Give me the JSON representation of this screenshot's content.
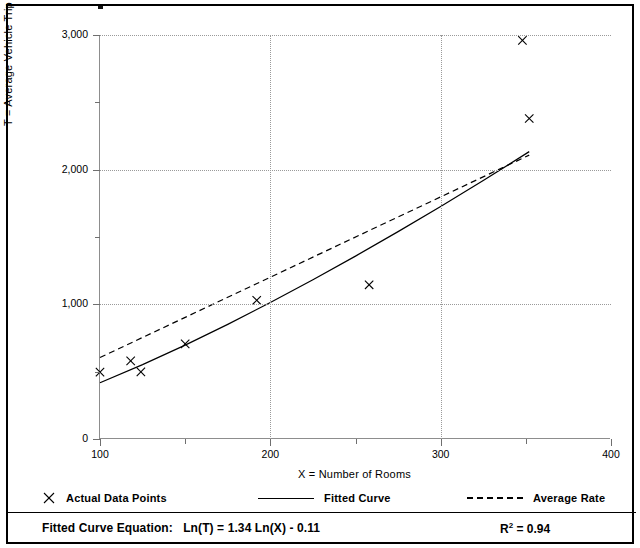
{
  "figure": {
    "frame_color": "#000000",
    "background": "#ffffff"
  },
  "chart_data": {
    "type": "scatter",
    "title": "",
    "xlabel": "X = Number of Rooms",
    "ylabel": "T = Average Vehicle Trip Ends",
    "xlim": [
      100,
      400
    ],
    "ylim": [
      0,
      3000
    ],
    "xticks": [
      100,
      200,
      300,
      400
    ],
    "xticklabels": [
      "100",
      "200",
      "300",
      "400"
    ],
    "xminorticks": [
      150,
      250,
      350
    ],
    "yticks": [
      0,
      1000,
      2000,
      3000
    ],
    "yticklabels": [
      "0",
      "1,000",
      "2,000",
      "3,000"
    ],
    "yminorticks": [
      500,
      1500,
      2500
    ],
    "grid": {
      "horizontal_at": [
        1000,
        2000,
        3000
      ],
      "vertical_at": [
        200,
        300
      ],
      "style": "dotted",
      "color": "#9a9a9a"
    },
    "series": [
      {
        "name": "Actual Data Points",
        "type": "scatter",
        "marker": "x",
        "color": "#000000",
        "points": [
          {
            "x": 100,
            "y": 497
          },
          {
            "x": 118,
            "y": 580
          },
          {
            "x": 124,
            "y": 498
          },
          {
            "x": 150,
            "y": 706
          },
          {
            "x": 192,
            "y": 1030
          },
          {
            "x": 258,
            "y": 1145
          },
          {
            "x": 348,
            "y": 2960
          },
          {
            "x": 352,
            "y": 2380
          }
        ]
      },
      {
        "name": "Fitted Curve",
        "type": "line",
        "linestyle": "solid",
        "color": "#000000",
        "equation": "Ln(T) = 1.34 Ln(X) - 0.11",
        "coefficients": {
          "slope": 1.34,
          "intercept": -0.11
        },
        "r_squared": 0.94,
        "points": [
          {
            "x": 100,
            "y": 418
          },
          {
            "x": 125,
            "y": 552
          },
          {
            "x": 150,
            "y": 697
          },
          {
            "x": 175,
            "y": 851
          },
          {
            "x": 200,
            "y": 1013
          },
          {
            "x": 225,
            "y": 1182
          },
          {
            "x": 250,
            "y": 1358
          },
          {
            "x": 275,
            "y": 1540
          },
          {
            "x": 300,
            "y": 1727
          },
          {
            "x": 325,
            "y": 1920
          },
          {
            "x": 352,
            "y": 2134
          }
        ]
      },
      {
        "name": "Average Rate",
        "type": "line",
        "linestyle": "dashed",
        "color": "#000000",
        "points": [
          {
            "x": 100,
            "y": 605
          },
          {
            "x": 352,
            "y": 2108
          }
        ]
      }
    ]
  },
  "legend": {
    "position": "below-axes",
    "items": [
      {
        "label": "Actual Data Points",
        "swatch": "x-marker-icon"
      },
      {
        "label": "Fitted Curve",
        "swatch": "solid-line-icon"
      },
      {
        "label": "Average Rate",
        "swatch": "dashed-line-icon"
      }
    ]
  },
  "footer": {
    "equation_label": "Fitted Curve Equation:",
    "equation_value": "Ln(T) = 1.34 Ln(X) - 0.11",
    "r2_label": "R",
    "r2_exponent": "2",
    "r2_value": "= 0.94"
  }
}
